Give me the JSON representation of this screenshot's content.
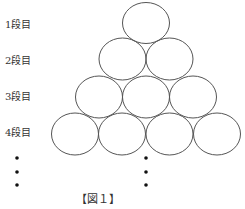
{
  "figure": {
    "caption": "【図１】",
    "row_labels": [
      "1段目",
      "2段目",
      "3段目",
      "4段目"
    ],
    "rows": [
      {
        "row": 1,
        "circles": 1
      },
      {
        "row": 2,
        "circles": 2
      },
      {
        "row": 3,
        "circles": 3
      },
      {
        "row": 4,
        "circles": 4
      }
    ],
    "continuation": "⋮",
    "colors": {
      "stroke": "#555555",
      "dot": "#111111",
      "background": "#ffffff"
    }
  }
}
